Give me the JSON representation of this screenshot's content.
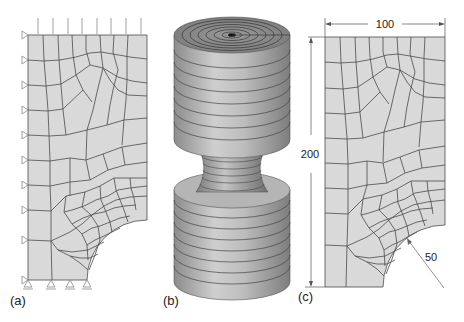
{
  "panels": [
    {
      "id": "a",
      "label": "(a)",
      "description": "2D quarter-plate mesh with boundary conditions"
    },
    {
      "id": "b",
      "label": "(b)",
      "description": "3D axisymmetric revolved mesh"
    },
    {
      "id": "c",
      "label": "(c)",
      "description": "Quarter-plate geometry with dimensions"
    }
  ],
  "dimensions": {
    "width": "100",
    "height": "200",
    "radius": "50"
  },
  "colors": {
    "mesh_fill": "#d9d9d9",
    "mesh_line": "#4a4a4a",
    "dim_line": "#555555",
    "cyl_light": "#c8c8c8",
    "cyl_dark": "#8a8a8a"
  }
}
